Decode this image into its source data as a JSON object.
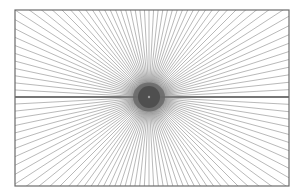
{
  "figure": {
    "width": 303,
    "height": 196,
    "background": "#ffffff",
    "frame": {
      "x": 15,
      "y": 10,
      "w": 274,
      "h": 176,
      "stroke": "#6b6b6b",
      "stroke_width": 1.2
    },
    "center": {
      "x": 149,
      "y": 97
    },
    "rays": {
      "count": 120,
      "color": "#8a8a8a",
      "width": 0.6
    },
    "horizontal_axis": {
      "color": "#555555",
      "width": 1.4
    },
    "core": {
      "outer_radius": 30,
      "outer_color": "#9a9a9a",
      "mid_radius": 16,
      "mid_color": "#6a6a6a",
      "inner_radius": 11,
      "inner_color": "#4f4f4f",
      "dot_radius": 1.2,
      "dot_color": "#a0a0a0"
    }
  }
}
